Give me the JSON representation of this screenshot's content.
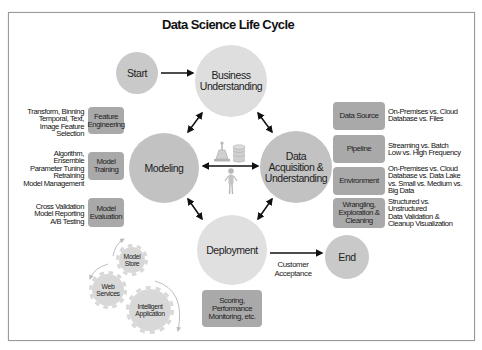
{
  "title": "Data Science Life Cycle",
  "stages": {
    "start": {
      "label": "Start"
    },
    "business": {
      "lines": [
        "Business",
        "Understanding"
      ]
    },
    "modeling": {
      "label": "Modeling"
    },
    "acquisition": {
      "lines": [
        "Data",
        "Acquisition &",
        "Understanding"
      ]
    },
    "deployment": {
      "label": "Deployment"
    },
    "end": {
      "label": "End"
    }
  },
  "modeling_steps": [
    {
      "label": [
        "Feature",
        "Engineering"
      ],
      "details": [
        "Transform, Binning",
        "Temporal, Text,",
        "Image Feature",
        "Selection"
      ]
    },
    {
      "label": [
        "Model",
        "Training"
      ],
      "details": [
        "Algorithm,",
        "Ensemble",
        "Parameter Tuning",
        "Retraining",
        "Model Management"
      ]
    },
    {
      "label": [
        "Model",
        "Evaluation"
      ],
      "details": [
        "Cross Validation",
        "Model Reporting",
        "A/B Testing"
      ]
    }
  ],
  "acquisition_steps": [
    {
      "label": [
        "Data Source"
      ],
      "details": [
        "On-Premises vs. Cloud",
        "Database vs. Files"
      ]
    },
    {
      "label": [
        "Pipeline"
      ],
      "details": [
        "Streaming vs. Batch",
        "Low vs. High Frequency"
      ]
    },
    {
      "label": [
        "Environment"
      ],
      "details": [
        "On-Premises vs. Cloud",
        "Database vs. Data Lake",
        "vs. Small vs. Medium vs.",
        "Big Data"
      ]
    },
    {
      "label": [
        "Wrangling,",
        "Exploration &",
        "Cleaning"
      ],
      "details": [
        "Structured vs.",
        "Unstructured",
        "Data Validation &",
        "Cleanup Visualization"
      ]
    }
  ],
  "deployment_details": {
    "label": [
      "Scoring,",
      "Performance",
      "Monitoring, etc."
    ]
  },
  "transition_label": [
    "Customer",
    "Acceptance"
  ],
  "gears": [
    {
      "label": [
        "Model",
        "Store"
      ]
    },
    {
      "label": [
        "Web",
        "Services"
      ]
    },
    {
      "label": [
        "Intelligent",
        "Application"
      ]
    }
  ],
  "center_icons": [
    "lab-flask-icon",
    "database-icon",
    "data-scientist-person-icon"
  ],
  "colors": {
    "circle_light": "#dedede",
    "circle_medium": "#c9c9c9",
    "circle_dark": "#c2c2c2",
    "box": "#a9a9a9",
    "gear": "#d8d8d8",
    "arrow": "#111111"
  }
}
